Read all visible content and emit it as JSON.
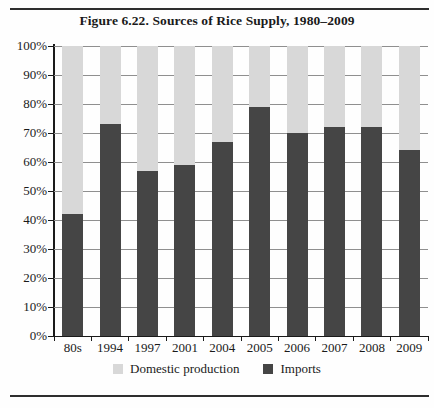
{
  "figure": {
    "title": "Figure 6.22. Sources of Rice Supply, 1980–2009"
  },
  "chart_data": {
    "type": "bar",
    "subtype": "stacked-100-percent",
    "title": "Figure 6.22. Sources of Rice Supply, 1980–2009",
    "categories": [
      "80s",
      "1994",
      "1997",
      "2001",
      "2004",
      "2005",
      "2006",
      "2007",
      "2008",
      "2009"
    ],
    "series": [
      {
        "name": "Domestic production",
        "color": "#d8d8d8",
        "values": [
          58,
          27,
          43,
          41,
          33,
          21,
          30,
          28,
          28,
          36
        ]
      },
      {
        "name": "Imports",
        "color": "#454545",
        "values": [
          42,
          73,
          57,
          59,
          67,
          79,
          70,
          72,
          72,
          64
        ]
      }
    ],
    "stack_order_bottom_to_top": [
      "Imports",
      "Domestic production"
    ],
    "xlabel": "",
    "ylabel": "",
    "ylim": [
      0,
      100
    ],
    "y_tick_labels": [
      "0%",
      "10%",
      "20%",
      "30%",
      "40%",
      "50%",
      "60%",
      "70%",
      "80%",
      "90%",
      "100%"
    ],
    "grid": true,
    "legend_position": "bottom",
    "colors": {
      "grid": "#8f8f8f",
      "axis": "#1a1a1a",
      "text": "#1a1a1a",
      "rule": "#2e2e2e",
      "background": "#fefefe"
    }
  }
}
